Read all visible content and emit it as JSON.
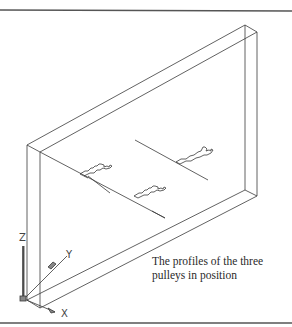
{
  "figure": {
    "caption_line1": "The profiles of the three",
    "caption_line2": "pulleys in position",
    "axes": {
      "x_label": "X",
      "y_label": "Y",
      "z_label": "Z"
    },
    "pulley_count": 3,
    "colors": {
      "line": "#3a3a3a",
      "border": "#555555",
      "background": "#ffffff"
    }
  }
}
